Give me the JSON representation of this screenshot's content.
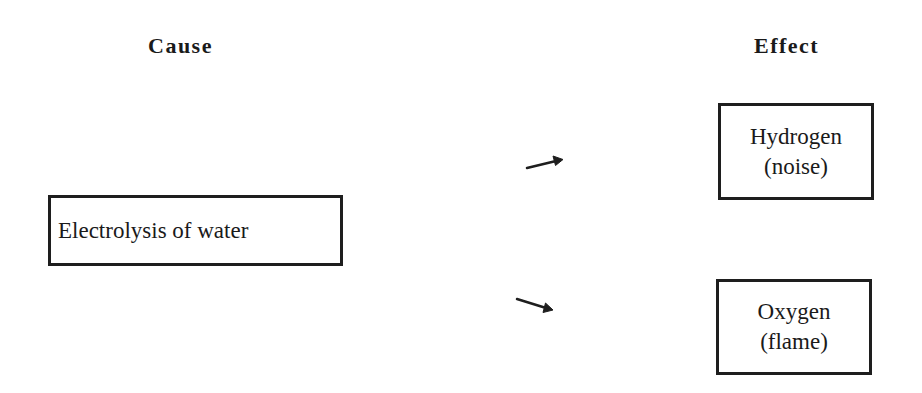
{
  "diagram": {
    "type": "cause-effect",
    "headings": {
      "cause": "Cause",
      "effect": "Effect"
    },
    "cause": {
      "label": "Electrolysis of water"
    },
    "effects": [
      {
        "line1": "Hydrogen",
        "line2": "(noise)"
      },
      {
        "line1": "Oxygen",
        "line2": "(flame)"
      }
    ],
    "arrows": [
      {
        "from": "cause",
        "to": "effect-1",
        "direction": "up-right"
      },
      {
        "from": "cause",
        "to": "effect-2",
        "direction": "down-right"
      }
    ],
    "colors": {
      "background": "#ffffff",
      "stroke": "#1e1e1e",
      "text": "#1a1a1a"
    }
  }
}
